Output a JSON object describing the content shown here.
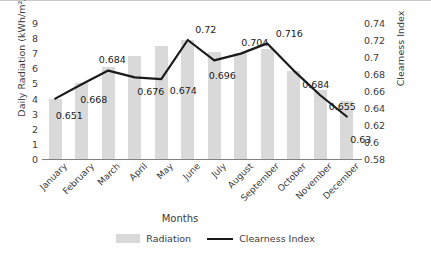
{
  "chart_data": {
    "type": "bar",
    "title": "",
    "categories": [
      "January",
      "February",
      "March",
      "April",
      "May",
      "June",
      "July",
      "August",
      "September",
      "October",
      "November",
      "December"
    ],
    "series": [
      {
        "name": "Radiation",
        "type": "bar",
        "axis": "left",
        "color": "#d9d9d9",
        "values": [
          3.95,
          5.05,
          6.1,
          6.85,
          7.5,
          7.85,
          7.1,
          7.0,
          7.25,
          5.85,
          4.6,
          3.85
        ]
      },
      {
        "name": "Clearness Index",
        "type": "line",
        "axis": "right",
        "color": "#1a1a1a",
        "values": [
          0.651,
          0.668,
          0.684,
          0.676,
          0.674,
          0.72,
          0.696,
          0.704,
          0.716,
          0.684,
          0.655,
          0.63
        ],
        "labels": [
          "0.651",
          "0.668",
          "0.684",
          "0.676",
          "0.674",
          "0.72",
          "0.696",
          "0.704",
          "0.716",
          "0.684",
          "0.655",
          "0.63"
        ]
      }
    ],
    "xlabel": "Months",
    "ylabel": "Daily Radiation (kWh/m²/day)",
    "y2label": "Clearness Index",
    "ylim": [
      0,
      9
    ],
    "yticks": [
      "0",
      "1",
      "2",
      "3",
      "4",
      "5",
      "6",
      "7",
      "8",
      "9"
    ],
    "y2lim": [
      0.58,
      0.74
    ],
    "y2ticks": [
      "0.58",
      "0.6",
      "0.62",
      "0.64",
      "0.66",
      "0.68",
      "0.7",
      "0.72",
      "0.74"
    ],
    "grid": false,
    "legend_position": "bottom",
    "legend": [
      "Radiation",
      "Clearness Index"
    ]
  }
}
